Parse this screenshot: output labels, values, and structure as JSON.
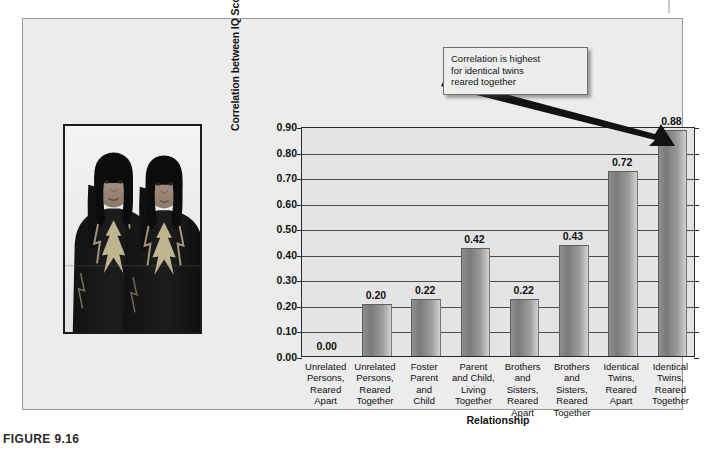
{
  "figure": {
    "caption": "FIGURE 9.16",
    "panel_bg": "#ececed"
  },
  "photo": {
    "alt_name": "identical-twins-photograph",
    "description": "Black and white photograph of two identical twin girls wearing dark embroidered shawls"
  },
  "callout": {
    "line1": "Correlation is highest",
    "line2": "for identical twins",
    "line3": "reared together",
    "arrow_target_value": "0.88"
  },
  "chart_data": {
    "type": "bar",
    "title": "",
    "xlabel": "Relationship",
    "ylabel": "Correlation between IQ Scores",
    "ylim": [
      0.0,
      0.9
    ],
    "ytick_step": 0.1,
    "grid": true,
    "legend": "none",
    "ytick_labels": [
      "0.00",
      "0.10",
      "0.20",
      "0.30",
      "0.40",
      "0.50",
      "0.60",
      "0.70",
      "0.80",
      "0.90"
    ],
    "categories": [
      "Unrelated\nPersons,\nReared\nApart",
      "Unrelated\nPersons,\nReared\nTogether",
      "Foster\nParent\nand\nChild",
      "Parent\nand Child,\nLiving\nTogether",
      "Brothers\nand\nSisters,\nReared\nApart",
      "Brothers\nand\nSisters,\nReared\nTogether",
      "Identical\nTwins,\nReared\nApart",
      "Identical\nTwins,\nReared\nTogether"
    ],
    "category_lines": [
      [
        "Unrelated",
        "Persons,",
        "Reared",
        "Apart"
      ],
      [
        "Unrelated",
        "Persons,",
        "Reared",
        "Together"
      ],
      [
        "Foster",
        "Parent",
        "and",
        "Child"
      ],
      [
        "Parent",
        "and Child,",
        "Living",
        "Together"
      ],
      [
        "Brothers",
        "and",
        "Sisters,",
        "Reared",
        "Apart"
      ],
      [
        "Brothers",
        "and",
        "Sisters,",
        "Reared",
        "Together"
      ],
      [
        "Identical",
        "Twins,",
        "Reared",
        "Apart"
      ],
      [
        "Identical",
        "Twins,",
        "Reared",
        "Together"
      ]
    ],
    "values": [
      0.0,
      0.2,
      0.22,
      0.42,
      0.22,
      0.43,
      0.72,
      0.88
    ],
    "value_labels": [
      "0.00",
      "0.20",
      "0.22",
      "0.42",
      "0.22",
      "0.43",
      "0.72",
      "0.88"
    ],
    "bar_color": "#8e8e90"
  }
}
